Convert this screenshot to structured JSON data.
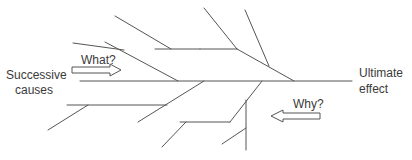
{
  "diagram": {
    "type": "fishbone",
    "labels": {
      "cause_line1": "Successive",
      "cause_line2": "causes",
      "effect_line1": "Ultimate",
      "effect_line2": "effect",
      "what": "What?",
      "why": "Why?"
    },
    "colors": {
      "line": "#555555",
      "text": "#3a3a3a",
      "background": "#ffffff"
    }
  }
}
